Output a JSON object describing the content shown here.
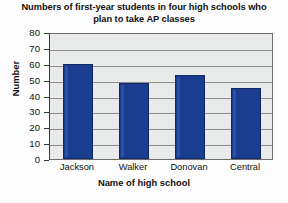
{
  "chart_data": {
    "type": "bar",
    "title": "Numbers of first-year students in four high schools who plan to take AP classes",
    "title_line1": "Numbers of first-year students in four high",
    "title_line2": "schools who plan to take AP classes",
    "categories": [
      "Jackson",
      "Walker",
      "Donovan",
      "Central"
    ],
    "values": [
      60,
      48,
      53,
      45
    ],
    "series": [
      {
        "name": "Number of first-year students",
        "values": [
          60,
          48,
          53,
          45
        ]
      }
    ],
    "xlabel": "Name of high school",
    "ylabel": "Number",
    "ylim": [
      0,
      80
    ],
    "ytick_labels": [
      "80",
      "70",
      "60",
      "50",
      "40",
      "30",
      "20",
      "10",
      "0"
    ],
    "ytick_values": [
      80,
      70,
      60,
      50,
      40,
      30,
      20,
      10,
      0
    ],
    "ytick_step": 10,
    "grid": true,
    "grid_axis": "y",
    "legend": false,
    "legend_position": "none",
    "bar_color": "#1b3d8f",
    "plot_background": "#e9eaea",
    "gridline_color": "#8c8c8c",
    "axis_color": "#3a3a3a"
  }
}
